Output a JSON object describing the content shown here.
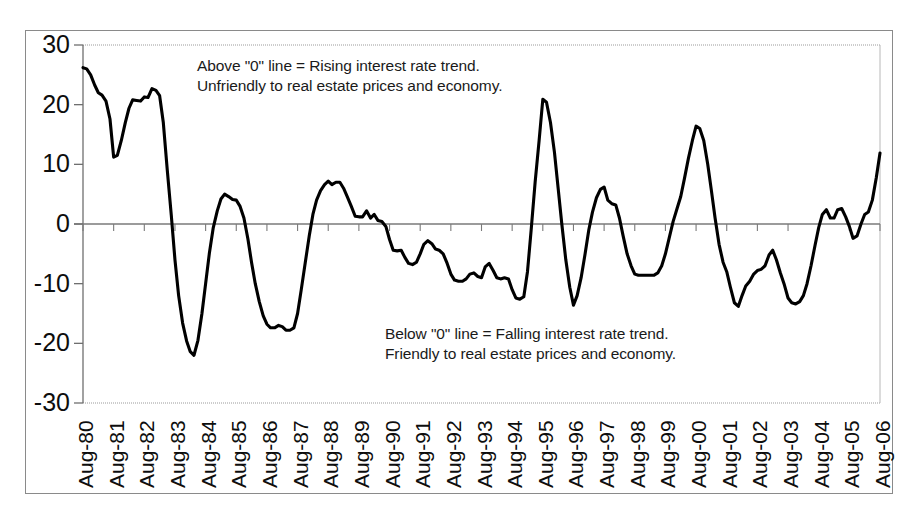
{
  "chart_data": {
    "type": "line",
    "title": "",
    "xlabel": "",
    "ylabel": "",
    "ylim": [
      -30,
      30
    ],
    "yticks": [
      30,
      20,
      10,
      0,
      -10,
      -20,
      -30
    ],
    "ytick_labels": [
      "30",
      "20",
      "10",
      "0",
      "-10",
      "-20",
      "-30"
    ],
    "grid": false,
    "zero_line": true,
    "legend": "none",
    "line_color": "#000000",
    "axis_color": "#8a8a8a",
    "categories": [
      "Aug-80",
      "Aug-81",
      "Aug-82",
      "Aug-83",
      "Aug-84",
      "Aug-85",
      "Aug-86",
      "Aug-87",
      "Aug-88",
      "Aug-89",
      "Aug-90",
      "Aug-91",
      "Aug-92",
      "Aug-93",
      "Aug-94",
      "Aug-95",
      "Aug-96",
      "Aug-97",
      "Aug-98",
      "Aug-99",
      "Aug-00",
      "Aug-01",
      "Aug-02",
      "Aug-03",
      "Aug-04",
      "Aug-05",
      "Aug-06"
    ],
    "xtick_labels": [
      "Aug-80",
      "Aug-81",
      "Aug-82",
      "Aug-83",
      "Aug-84",
      "Aug-85",
      "Aug-86",
      "Aug-87",
      "Aug-88",
      "Aug-89",
      "Aug-90",
      "Aug-91",
      "Aug-92",
      "Aug-93",
      "Aug-94",
      "Aug-95",
      "Aug-96",
      "Aug-97",
      "Aug-98",
      "Aug-99",
      "Aug-00",
      "Aug-01",
      "Aug-02",
      "Aug-03",
      "Aug-04",
      "Aug-05",
      "Aug-06"
    ],
    "series": [
      {
        "name": "Interest rate trend index",
        "x": [
          0.0,
          0.12,
          0.25,
          0.38,
          0.5,
          0.62,
          0.75,
          0.88,
          1.0,
          1.12,
          1.25,
          1.38,
          1.5,
          1.62,
          1.75,
          1.88,
          2.0,
          2.12,
          2.25,
          2.38,
          2.5,
          2.62,
          2.75,
          2.88,
          3.0,
          3.12,
          3.25,
          3.38,
          3.5,
          3.62,
          3.75,
          3.88,
          4.0,
          4.12,
          4.25,
          4.38,
          4.5,
          4.62,
          4.75,
          4.88,
          5.0,
          5.12,
          5.25,
          5.38,
          5.5,
          5.62,
          5.75,
          5.88,
          6.0,
          6.12,
          6.25,
          6.38,
          6.5,
          6.62,
          6.75,
          6.88,
          7.0,
          7.12,
          7.25,
          7.38,
          7.5,
          7.62,
          7.75,
          7.88,
          8.0,
          8.12,
          8.25,
          8.38,
          8.5,
          8.62,
          8.75,
          8.88,
          9.0,
          9.12,
          9.25,
          9.38,
          9.5,
          9.62,
          9.75,
          9.88,
          10.0,
          10.12,
          10.25,
          10.38,
          10.5,
          10.62,
          10.75,
          10.88,
          11.0,
          11.12,
          11.25,
          11.38,
          11.5,
          11.62,
          11.75,
          11.88,
          12.0,
          12.12,
          12.25,
          12.38,
          12.5,
          12.62,
          12.75,
          12.88,
          13.0,
          13.12,
          13.25,
          13.38,
          13.5,
          13.62,
          13.75,
          13.88,
          14.0,
          14.12,
          14.25,
          14.38,
          14.5,
          14.62,
          14.75,
          14.88,
          15.0,
          15.12,
          15.25,
          15.38,
          15.5,
          15.62,
          15.75,
          15.88,
          16.0,
          16.12,
          16.25,
          16.38,
          16.5,
          16.62,
          16.75,
          16.88,
          17.0,
          17.12,
          17.25,
          17.38,
          17.5,
          17.62,
          17.75,
          17.88,
          18.0,
          18.12,
          18.25,
          18.38,
          18.5,
          18.62,
          18.75,
          18.88,
          19.0,
          19.12,
          19.25,
          19.38,
          19.5,
          19.62,
          19.75,
          19.88,
          20.0,
          20.12,
          20.25,
          20.38,
          20.5,
          20.62,
          20.75,
          20.88,
          21.0,
          21.12,
          21.25,
          21.38,
          21.5,
          21.62,
          21.75,
          21.88,
          22.0,
          22.12,
          22.25,
          22.38,
          22.5,
          22.62,
          22.75,
          22.88,
          23.0,
          23.12,
          23.25,
          23.38,
          23.5,
          23.62,
          23.75,
          23.88,
          24.0,
          24.12,
          24.25,
          24.38,
          24.5,
          24.62,
          24.75,
          24.88,
          25.0,
          25.12,
          25.25,
          25.38,
          25.5,
          25.62,
          25.75,
          25.88,
          26.0
        ],
        "values": [
          26.2,
          26.0,
          25.0,
          23.3,
          22.0,
          21.6,
          20.6,
          17.6,
          11.2,
          11.5,
          14.0,
          17.0,
          19.4,
          20.8,
          20.7,
          20.6,
          21.3,
          21.2,
          22.7,
          22.4,
          21.5,
          17.0,
          9.0,
          1.5,
          -6.0,
          -12.0,
          -16.6,
          -19.6,
          -21.4,
          -22.0,
          -19.5,
          -15.0,
          -10.0,
          -5.0,
          -0.6,
          2.2,
          4.2,
          5.0,
          4.6,
          4.1,
          4.0,
          3.0,
          1.0,
          -2.5,
          -6.5,
          -10.0,
          -13.0,
          -15.4,
          -16.8,
          -17.4,
          -17.4,
          -17.0,
          -17.2,
          -17.8,
          -17.8,
          -17.4,
          -15.0,
          -11.0,
          -6.5,
          -2.0,
          1.6,
          4.0,
          5.6,
          6.6,
          7.2,
          6.6,
          7.0,
          7.0,
          6.0,
          4.6,
          3.0,
          1.3,
          1.2,
          1.2,
          2.2,
          1.0,
          1.6,
          0.6,
          0.4,
          -0.4,
          -2.6,
          -4.4,
          -4.5,
          -4.4,
          -5.6,
          -6.6,
          -6.8,
          -6.4,
          -5.0,
          -3.4,
          -2.8,
          -3.3,
          -4.2,
          -4.4,
          -5.0,
          -6.6,
          -8.4,
          -9.4,
          -9.6,
          -9.6,
          -9.2,
          -8.4,
          -8.2,
          -8.8,
          -9.0,
          -7.2,
          -6.6,
          -7.8,
          -9.0,
          -9.2,
          -9.0,
          -9.2,
          -11.0,
          -12.4,
          -12.6,
          -12.2,
          -8.0,
          -1.0,
          7.0,
          14.0,
          20.9,
          20.4,
          17.0,
          12.0,
          6.0,
          0.0,
          -6.0,
          -10.6,
          -13.6,
          -12.0,
          -9.0,
          -5.0,
          -1.0,
          2.0,
          4.4,
          5.8,
          6.2,
          4.0,
          3.4,
          3.2,
          1.0,
          -2.0,
          -5.0,
          -7.0,
          -8.4,
          -8.6,
          -8.6,
          -8.6,
          -8.6,
          -8.6,
          -8.2,
          -7.0,
          -5.0,
          -2.4,
          0.4,
          2.6,
          4.6,
          7.6,
          11.0,
          14.0,
          16.4,
          16.0,
          14.0,
          10.0,
          5.6,
          1.0,
          -3.4,
          -6.4,
          -8.0,
          -10.6,
          -13.2,
          -13.8,
          -12.0,
          -10.4,
          -9.6,
          -8.4,
          -7.8,
          -7.6,
          -7.0,
          -5.2,
          -4.4,
          -6.0,
          -8.2,
          -10.2,
          -12.4,
          -13.2,
          -13.4,
          -13.0,
          -12.0,
          -10.0,
          -7.0,
          -3.6,
          -0.6,
          1.6,
          2.4,
          1.0,
          1.0,
          2.4,
          2.6,
          1.2,
          -0.4,
          -2.4,
          -2.0,
          0.0,
          1.6,
          2.0,
          4.0,
          7.8,
          11.9
        ]
      }
    ],
    "annotations": [
      {
        "id": "above-zero-note",
        "line1": "Above \"0\" line = Rising interest rate trend.",
        "line2": "Unfriendly to real estate prices and economy."
      },
      {
        "id": "below-zero-note",
        "line1": "Below \"0\" line = Falling interest rate trend.",
        "line2": "Friendly to real estate prices and economy."
      }
    ]
  }
}
